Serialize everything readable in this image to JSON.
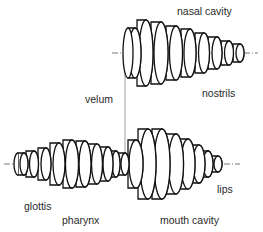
{
  "diagram": {
    "type": "vocal-tract-tube-model",
    "labels": {
      "nasal_cavity": "nasal cavity",
      "nostrils": "nostrils",
      "velum": "velum",
      "glottis": "glottis",
      "pharynx": "pharynx",
      "mouth_cavity": "mouth cavity",
      "lips": "lips"
    },
    "colors": {
      "stroke": "#111111",
      "axis": "#555555",
      "fill": "#ffffff",
      "text": "#2a2a2a"
    }
  }
}
